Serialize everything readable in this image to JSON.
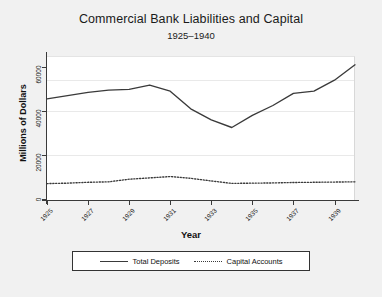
{
  "chart_data": {
    "type": "line",
    "title": "Commercial Bank Liabilities and Capital",
    "subtitle": "1925–1940",
    "xlabel": "Year",
    "ylabel": "Millions of Dollars",
    "x": [
      1925,
      1926,
      1927,
      1928,
      1929,
      1930,
      1931,
      1932,
      1933,
      1934,
      1935,
      1936,
      1937,
      1938,
      1939,
      1940
    ],
    "xlim": [
      1925,
      1940
    ],
    "ylim": [
      0,
      65000
    ],
    "xticks": [
      1925,
      1927,
      1929,
      1931,
      1933,
      1935,
      1937,
      1939
    ],
    "xtick_labels": [
      "1925",
      "1927",
      "1929",
      "1931",
      "1933",
      "1935",
      "1937",
      "1939"
    ],
    "yticks": [
      0,
      20000,
      40000,
      60000
    ],
    "ytick_labels": [
      "0",
      "20000",
      "40000",
      "60000"
    ],
    "grid": true,
    "legend_position": "bottom",
    "series": [
      {
        "name": "Total Deposits",
        "style": "solid",
        "color": "#3a3a3a",
        "values": [
          45500,
          47000,
          48500,
          49500,
          49800,
          51800,
          49000,
          41000,
          36000,
          32500,
          38000,
          42500,
          48000,
          48500,
          48800,
          49000
        ]
      },
      {
        "name": "Capital Accounts",
        "style": "dotted",
        "color": "#3a3a3a",
        "values": [
          7000,
          7200,
          7600,
          7800,
          9000,
          9600,
          10200,
          9400,
          8200,
          7100,
          7200,
          7300,
          7500,
          7600,
          7700,
          7800
        ]
      }
    ],
    "series_extra_note": ""
  },
  "chart_tail": {
    "deposits_tail_x": [
      1938,
      1939,
      1940
    ],
    "deposits_tail_values": [
      49000,
      54000,
      61000
    ]
  },
  "legend": {
    "entries": [
      {
        "label": "Total Deposits",
        "key": "solid-line-key"
      },
      {
        "label": "Capital Accounts",
        "key": "dotted-line-key"
      }
    ]
  }
}
